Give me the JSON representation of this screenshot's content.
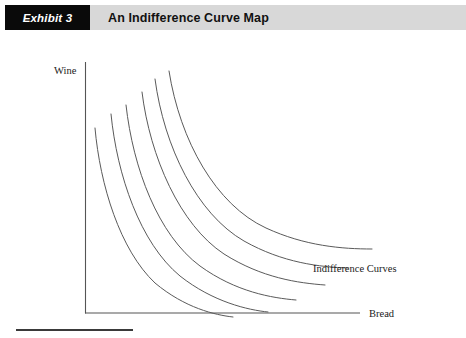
{
  "header": {
    "badge_label": "Exhibit 3",
    "title": "An Indifference Curve Map",
    "badge_bg": "#0a0a0a",
    "badge_fg": "#ffffff",
    "band_bg": "#d8d8d8"
  },
  "figure": {
    "y_axis_label": "Wine",
    "x_axis_label": "Bread",
    "annotation": "Indifference Curves",
    "axis_color": "#555555",
    "curve_color": "#5a5a5a"
  },
  "chart_data": {
    "type": "line",
    "title": "An Indifference Curve Map",
    "xlabel": "Bread",
    "ylabel": "Wine",
    "grid": false,
    "legend": "none",
    "annotations": [
      {
        "text": "Indifference Curves",
        "x": 313,
        "y": 270
      }
    ],
    "axes": {
      "origin": {
        "x": 85,
        "y": 313
      },
      "y_top": {
        "x": 85,
        "y": 62
      },
      "x_right": {
        "x": 360,
        "y": 313
      },
      "xlim": [
        0,
        1
      ],
      "ylim": [
        0,
        1
      ]
    },
    "series": [
      {
        "name": "U1",
        "utility_rank": 1,
        "path": "M 95,128 C 100,185 120,250 155,283 C 185,308 215,315 233,317",
        "start": {
          "x": 95,
          "y": 128
        },
        "end": {
          "x": 233,
          "y": 317
        }
      },
      {
        "name": "U2",
        "utility_rank": 2,
        "path": "M 111,114 C 117,175 140,243 180,276 C 213,302 248,310 268,312",
        "start": {
          "x": 111,
          "y": 114
        },
        "end": {
          "x": 268,
          "y": 312
        }
      },
      {
        "name": "U3",
        "utility_rank": 3,
        "path": "M 126,105 C 133,168 158,235 200,266 C 236,292 272,298 296,300",
        "start": {
          "x": 126,
          "y": 105
        },
        "end": {
          "x": 296,
          "y": 300
        }
      },
      {
        "name": "U4",
        "utility_rank": 4,
        "path": "M 142,92 C 150,157 180,225 224,254 C 262,278 298,283 325,285",
        "start": {
          "x": 142,
          "y": 92
        },
        "end": {
          "x": 325,
          "y": 285
        }
      },
      {
        "name": "U5",
        "utility_rank": 5,
        "path": "M 155,79 C 164,147 197,214 244,241 C 283,263 320,267 348,268",
        "start": {
          "x": 155,
          "y": 79
        },
        "end": {
          "x": 348,
          "y": 268
        }
      },
      {
        "name": "U6",
        "utility_rank": 6,
        "path": "M 169,71 C 180,141 216,205 266,228 C 305,246 342,249 372,249",
        "start": {
          "x": 169,
          "y": 71
        },
        "end": {
          "x": 372,
          "y": 249
        }
      }
    ]
  }
}
